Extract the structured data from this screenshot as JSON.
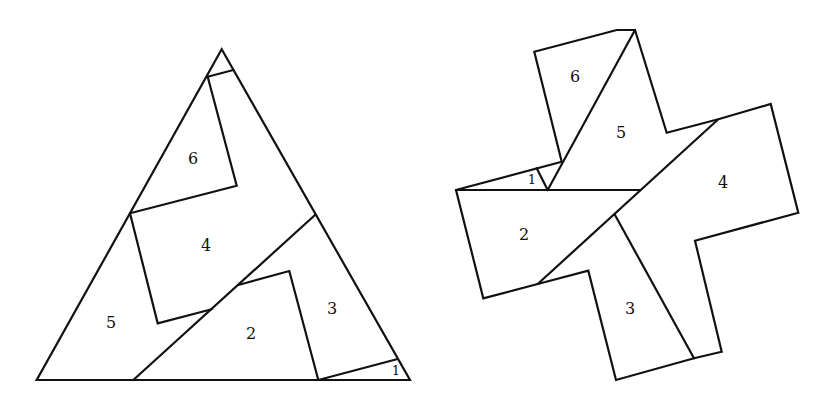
{
  "figure": {
    "left_shape": {
      "name": "triangle",
      "labels": [
        {
          "id": "piece-6",
          "text": "6",
          "x": 193,
          "y": 159
        },
        {
          "id": "piece-4",
          "text": "4",
          "x": 206,
          "y": 246
        },
        {
          "id": "piece-5",
          "text": "5",
          "x": 111,
          "y": 323
        },
        {
          "id": "piece-2",
          "text": "2",
          "x": 251,
          "y": 334
        },
        {
          "id": "piece-3",
          "text": "3",
          "x": 332,
          "y": 309
        },
        {
          "id": "piece-1",
          "text": "1",
          "x": 395,
          "y": 371
        }
      ]
    },
    "right_shape": {
      "name": "cross",
      "labels": [
        {
          "id": "piece-6",
          "text": "6",
          "x": 575,
          "y": 77
        },
        {
          "id": "piece-5",
          "text": "5",
          "x": 621,
          "y": 133
        },
        {
          "id": "piece-4",
          "text": "4",
          "x": 723,
          "y": 183
        },
        {
          "id": "piece-1",
          "text": "1",
          "x": 532,
          "y": 180
        },
        {
          "id": "piece-2",
          "text": "2",
          "x": 524,
          "y": 235
        },
        {
          "id": "piece-3",
          "text": "3",
          "x": 630,
          "y": 309
        }
      ]
    },
    "colors": {
      "stroke": "#111111",
      "background": "#ffffff"
    }
  }
}
